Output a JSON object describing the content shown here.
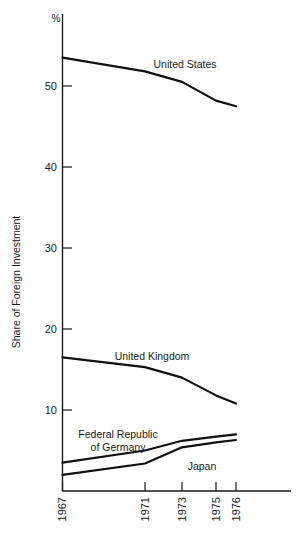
{
  "chart_data": {
    "type": "line",
    "title": "",
    "subtitle": "",
    "xlabel": "",
    "ylabel": "Share of Foreign Investment",
    "unit_label": "%",
    "x": [
      1967,
      1971,
      1973,
      1975,
      1976
    ],
    "x_tick_labels": [
      "1967",
      "1971",
      "1973",
      "1975",
      "1976"
    ],
    "y_tick_labels": [
      "10",
      "20",
      "30",
      "40",
      "50"
    ],
    "y_ticks": [
      10,
      20,
      30,
      40,
      50
    ],
    "ylim": [
      0,
      56
    ],
    "xlim": [
      1967,
      1976
    ],
    "grid": false,
    "legend_position": "inline-annotations",
    "series": [
      {
        "name": "United States",
        "label": "United States",
        "values": [
          53.5,
          51.8,
          50.5,
          48.2,
          47.5
        ]
      },
      {
        "name": "United Kingdom",
        "label": "United Kingdom",
        "values": [
          16.5,
          15.3,
          14.0,
          11.8,
          10.8
        ]
      },
      {
        "name": "Federal Republic of Germany",
        "label": "Federal Republic\nof Germany",
        "label_line1": "Federal Republic",
        "label_line2": "of Germany",
        "values": [
          3.5,
          5.0,
          6.2,
          6.7,
          7.0
        ]
      },
      {
        "name": "Japan",
        "label": "Japan",
        "values": [
          2.0,
          3.4,
          5.4,
          6.0,
          6.3
        ]
      }
    ]
  },
  "annotations": {
    "united_states": "United States",
    "united_kingdom": "United Kingdom",
    "germany_line1": "Federal Republic",
    "germany_line2": "of Germany",
    "japan": "Japan"
  },
  "colors": {
    "line": "#101010",
    "axis": "#1a1a1a",
    "background": "#ffffff",
    "text": "#1a1a1a"
  }
}
